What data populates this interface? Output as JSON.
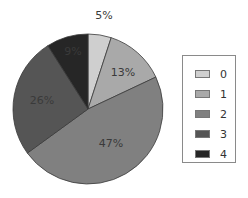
{
  "chart_data": {
    "type": "pie",
    "title": "",
    "categories": [
      "0",
      "1",
      "2",
      "3",
      "4"
    ],
    "values": [
      5,
      13,
      47,
      26,
      9
    ],
    "labels": [
      "5%",
      "13%",
      "47%",
      "26%",
      "9%"
    ],
    "colors": [
      "#cfcfcf",
      "#a9a9a9",
      "#808080",
      "#555555",
      "#262626"
    ],
    "start_angle_deg": 0,
    "direction": "clockwise",
    "legend_position": "right"
  },
  "legend": {
    "items": [
      {
        "label": "0",
        "color": "#cfcfcf"
      },
      {
        "label": "1",
        "color": "#a9a9a9"
      },
      {
        "label": "2",
        "color": "#808080"
      },
      {
        "label": "3",
        "color": "#555555"
      },
      {
        "label": "4",
        "color": "#262626"
      }
    ]
  }
}
